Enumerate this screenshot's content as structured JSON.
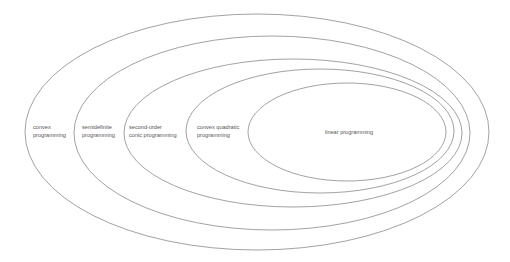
{
  "diagram": {
    "type": "nested-ellipses",
    "stroke_color": "#8a8a8a",
    "text_color": "#555555",
    "sets": [
      {
        "id": "convex",
        "lines": [
          "convex",
          "programming"
        ]
      },
      {
        "id": "semidefinite",
        "lines": [
          "semidefinite",
          "programming"
        ]
      },
      {
        "id": "socp",
        "lines": [
          "second-order",
          "conic programming"
        ]
      },
      {
        "id": "cqp",
        "lines": [
          "convex quadratic",
          "programming"
        ]
      },
      {
        "id": "lp",
        "lines": [
          "linear programming"
        ]
      }
    ]
  }
}
